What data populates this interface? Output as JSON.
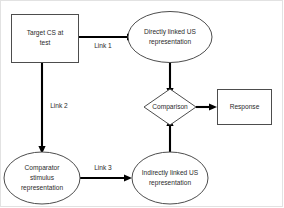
{
  "diagram": {
    "nodes": {
      "target_cs": {
        "label_line1": "Target CS at",
        "label_line2": "test",
        "shape": "rectangle"
      },
      "direct_us": {
        "label_line1": "Directly linked US",
        "label_line2": "representation",
        "shape": "ellipse"
      },
      "comparator_stimulus": {
        "label_line1": "Comparator",
        "label_line2": "stimulus",
        "label_line3": "representation",
        "shape": "ellipse"
      },
      "indirect_us": {
        "label_line1": "Indirectly linked US",
        "label_line2": "representation",
        "shape": "ellipse"
      },
      "comparison": {
        "label": "Comparison",
        "shape": "diamond"
      },
      "response": {
        "label": "Response",
        "shape": "rectangle"
      }
    },
    "edges": {
      "link1": {
        "label": "Link 1",
        "from": "target_cs",
        "to": "direct_us"
      },
      "link2": {
        "label": "Link 2",
        "from": "target_cs",
        "to": "comparator_stimulus"
      },
      "link3": {
        "label": "Link 3",
        "from": "comparator_stimulus",
        "to": "indirect_us"
      },
      "direct_to_comparison": {
        "label": "",
        "from": "direct_us",
        "to": "comparison"
      },
      "indirect_to_comparison": {
        "label": "",
        "from": "indirect_us",
        "to": "comparison"
      },
      "comparison_to_response": {
        "label": "",
        "from": "comparison",
        "to": "response"
      }
    },
    "colors": {
      "shape_stroke": "#4d4d4d",
      "edge_stroke": "#000000",
      "text": "#2b2b2b",
      "background": "#ffffff",
      "frame": "#e2e2e2"
    }
  }
}
